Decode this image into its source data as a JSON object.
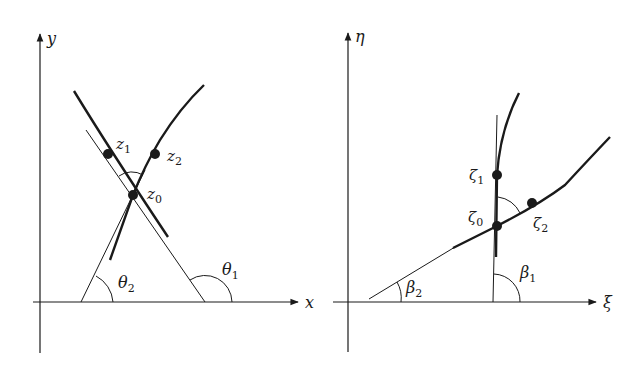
{
  "figure": {
    "left_panel": {
      "axes": {
        "x_label": "x",
        "y_label": "y"
      },
      "points": [
        {
          "name": "z",
          "sub": "1"
        },
        {
          "name": "z",
          "sub": "2"
        },
        {
          "name": "z",
          "sub": "0"
        }
      ],
      "angles": [
        {
          "name": "θ",
          "sub": "2"
        },
        {
          "name": "θ",
          "sub": "1"
        }
      ]
    },
    "right_panel": {
      "axes": {
        "x_label": "ξ",
        "y_label": "η"
      },
      "points": [
        {
          "name": "ζ",
          "sub": "1"
        },
        {
          "name": "ζ",
          "sub": "0"
        },
        {
          "name": "ζ",
          "sub": "2"
        }
      ],
      "angles": [
        {
          "name": "β",
          "sub": "2"
        },
        {
          "name": "β",
          "sub": "1"
        }
      ]
    },
    "colors": {
      "ink": "#1a1a1a",
      "background": "#ffffff"
    }
  }
}
